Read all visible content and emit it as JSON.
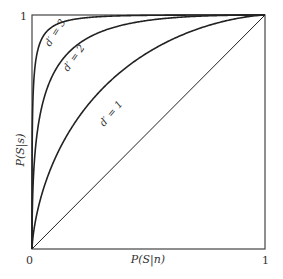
{
  "chart_data": {
    "type": "line",
    "title": "",
    "xlabel": "P(S|n)",
    "ylabel": "P(S|s)",
    "xlim": [
      0,
      1
    ],
    "ylim": [
      0,
      1
    ],
    "x_ticks": [
      "0",
      "1"
    ],
    "y_ticks": [
      "0",
      "1"
    ],
    "grid": false,
    "legend": "none (inline curve labels)",
    "series": [
      {
        "name": "d′ = 3",
        "dprime": 3,
        "x": [
          0,
          0.01,
          0.05,
          0.1,
          0.2,
          0.3,
          0.5,
          0.7,
          1.0
        ],
        "y": [
          0,
          0.58,
          0.85,
          0.93,
          0.97,
          0.985,
          0.996,
          0.999,
          1.0
        ]
      },
      {
        "name": "d′ = 2",
        "dprime": 2,
        "x": [
          0,
          0.01,
          0.05,
          0.1,
          0.2,
          0.3,
          0.5,
          0.7,
          1.0
        ],
        "y": [
          0,
          0.27,
          0.54,
          0.69,
          0.83,
          0.9,
          0.96,
          0.985,
          1.0
        ]
      },
      {
        "name": "d′ = 1",
        "dprime": 1,
        "x": [
          0,
          0.01,
          0.05,
          0.1,
          0.2,
          0.3,
          0.5,
          0.7,
          1.0
        ],
        "y": [
          0,
          0.06,
          0.19,
          0.3,
          0.46,
          0.58,
          0.76,
          0.89,
          1.0
        ]
      },
      {
        "name": "chance (d′ = 0)",
        "dprime": 0,
        "x": [
          0,
          1
        ],
        "y": [
          0,
          1
        ]
      }
    ],
    "annotations": [
      "d′ = 3",
      "d′ = 2",
      "d′ = 1"
    ]
  },
  "labels": {
    "x_axis": "P(S|n)",
    "y_axis": "P(S|s)",
    "origin": "0",
    "x_max": "1",
    "y_max": "1",
    "curve3": "d′ = 3",
    "curve2": "d′ = 2",
    "curve1": "d′ = 1"
  }
}
